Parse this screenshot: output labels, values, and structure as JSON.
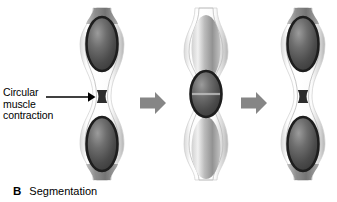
{
  "figure": {
    "panel_letter": "B",
    "panel_title": "Segmentation",
    "callout": {
      "name": "circular-muscle-contraction",
      "lines": [
        "Circular",
        "muscle",
        "contraction"
      ],
      "pointer_icon": "leader-arrow-right-icon"
    },
    "flow_arrows": [
      {
        "name": "flow-arrow-1",
        "icon": "block-arrow-right-icon"
      },
      {
        "name": "flow-arrow-2",
        "icon": "block-arrow-right-icon"
      }
    ],
    "panels": [
      {
        "name": "intestine-stage-1",
        "label": "stage-1",
        "constriction_phase": "contracted-at-midpoint",
        "segments": [
          {
            "name": "bolus-upper",
            "shade": "dark"
          },
          {
            "name": "bolus-lower",
            "shade": "dark"
          }
        ]
      },
      {
        "name": "intestine-stage-2",
        "label": "stage-2",
        "constriction_phase": "contracted-offset",
        "segments": [
          {
            "name": "bolus-top",
            "shade": "light"
          },
          {
            "name": "bolus-middle",
            "shade": "dark"
          },
          {
            "name": "bolus-bottom",
            "shade": "light"
          }
        ]
      },
      {
        "name": "intestine-stage-3",
        "label": "stage-3",
        "constriction_phase": "contracted-at-midpoint",
        "segments": [
          {
            "name": "bolus-upper",
            "shade": "dark"
          },
          {
            "name": "bolus-lower",
            "shade": "dark"
          }
        ]
      }
    ],
    "colors": {
      "background": "#ffffff",
      "arrow_gray": "#868686",
      "wall_light": "#f2f2f2",
      "wall_mid": "#c9c9c9",
      "bolus_dark": "#4a4a4a",
      "bolus_outline": "#1d1d1d",
      "bolus_light": "#b6b6b6",
      "text": "#000000"
    }
  }
}
